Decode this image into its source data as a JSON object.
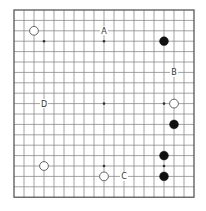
{
  "board": {
    "size": 19,
    "origin_x": 14,
    "origin_y": 10,
    "spacing_x": 10,
    "spacing_y": 10.4,
    "stone_radius": 4.4,
    "colors": {
      "line": "#8a8a8a",
      "border": "#4a4a4a",
      "black": "#111111",
      "white": "#ffffff"
    }
  },
  "star_points": [
    [
      3,
      3
    ],
    [
      9,
      3
    ],
    [
      15,
      3
    ],
    [
      3,
      9
    ],
    [
      9,
      9
    ],
    [
      15,
      9
    ],
    [
      3,
      15
    ],
    [
      9,
      15
    ],
    [
      15,
      15
    ]
  ],
  "stones": [
    {
      "color": "white",
      "col": 2,
      "row": 2
    },
    {
      "color": "black",
      "col": 15,
      "row": 3
    },
    {
      "color": "white",
      "col": 16,
      "row": 9
    },
    {
      "color": "black",
      "col": 16,
      "row": 11
    },
    {
      "color": "black",
      "col": 15,
      "row": 14
    },
    {
      "color": "black",
      "col": 15,
      "row": 16
    },
    {
      "color": "white",
      "col": 3,
      "row": 15
    },
    {
      "color": "white",
      "col": 9,
      "row": 16
    }
  ],
  "labels": [
    {
      "text": "A",
      "col": 9,
      "row": 2
    },
    {
      "text": "B",
      "col": 16,
      "row": 6
    },
    {
      "text": "C",
      "col": 11,
      "row": 16
    },
    {
      "text": "D",
      "col": 3,
      "row": 9
    }
  ]
}
